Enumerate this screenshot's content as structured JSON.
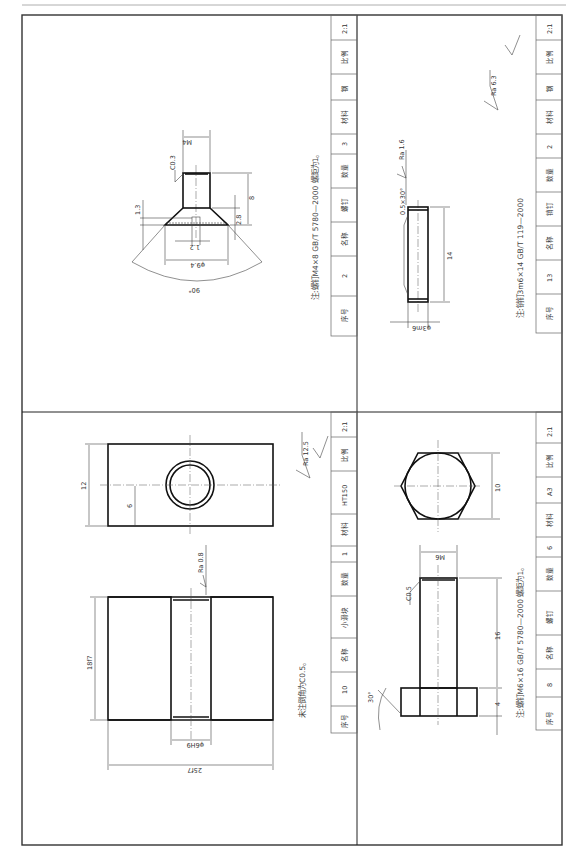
{
  "page": {
    "header_rule": true
  },
  "parts": [
    {
      "quadrant": "top-left",
      "note": "注:螺钉M4×8 GB/T 5780—2000 螺距为1。",
      "title_block": [
        {
          "label": "序号",
          "value": "2"
        },
        {
          "label": "名称",
          "value": "螺钉"
        },
        {
          "label": "数量",
          "value": "3"
        },
        {
          "label": "材料",
          "value": "钢"
        },
        {
          "label": "比例",
          "value": "2:1"
        }
      ],
      "dimensions": {
        "thread": "M4",
        "chamfer": "C0.3",
        "length": "8",
        "head_height": "2.8",
        "slot_depth": "1.3",
        "slot_width": "1.2",
        "head_dia": "φ9.4",
        "angle": "90°"
      }
    },
    {
      "quadrant": "top-right",
      "note": "注:销钉3m6×14 GB/T 119—2000",
      "title_block": [
        {
          "label": "序号",
          "value": "13"
        },
        {
          "label": "名称",
          "value": "销钉"
        },
        {
          "label": "数量",
          "value": "2"
        },
        {
          "label": "材料",
          "value": "钢"
        },
        {
          "label": "比例",
          "value": "2:1"
        }
      ],
      "dimensions": {
        "diameter": "φ3m6",
        "length": "14",
        "chamfer": "0.5×30°",
        "roughness": "Ra 1.6",
        "general_roughness": "Ra 6.3"
      }
    },
    {
      "quadrant": "bottom-left",
      "note": "未注倒角为C0.5。",
      "title_block": [
        {
          "label": "序号",
          "value": "10"
        },
        {
          "label": "名称",
          "value": "小滑块"
        },
        {
          "label": "数量",
          "value": "1"
        },
        {
          "label": "材料",
          "value": "HT150"
        },
        {
          "label": "比例",
          "value": "2:1"
        }
      ],
      "dimensions": {
        "width": "25f7",
        "height": "18f7",
        "hole": "φ6H9",
        "depth": "12",
        "center": "6",
        "roughness": "Ra 0.8",
        "general_roughness": "Ra 12.5"
      }
    },
    {
      "quadrant": "bottom-right",
      "note": "注:螺钉M6×16 GB/T 5780—2000 螺距为1。",
      "title_block": [
        {
          "label": "序号",
          "value": "8"
        },
        {
          "label": "名称",
          "value": "螺钉"
        },
        {
          "label": "数量",
          "value": "6"
        },
        {
          "label": "材料",
          "value": "A3"
        },
        {
          "label": "比例",
          "value": "2:1"
        }
      ],
      "dimensions": {
        "thread": "M6",
        "chamfer": "C0.5",
        "length": "16",
        "head_height": "4",
        "across_flats": "10",
        "angle": "30°"
      }
    }
  ]
}
